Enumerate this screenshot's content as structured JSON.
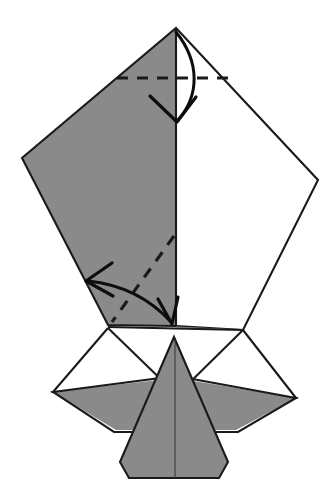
{
  "document": {
    "kind": "origami-folding-diagram",
    "title": "Origami fold step diagram",
    "canvas": {
      "width": 332,
      "height": 502
    },
    "background_color": "#ffffff"
  },
  "palette": {
    "paper_back_gray": "#8a8a8a",
    "paper_front_white": "#ffffff",
    "edge_black": "#1a1a1a",
    "crease_black": "#1a1a1a",
    "arrow_black": "#0d0d0d",
    "faint_edge": "#9a9a9a"
  },
  "geometry": {
    "apex": [
      176,
      28
    ],
    "left_vertex": [
      22,
      158
    ],
    "right_vertex": [
      318,
      180
    ],
    "center_line_x": 176,
    "mid_horizontal_y": 327,
    "body_apex": [
      174,
      337
    ],
    "body_bottom_left": [
      122,
      478
    ],
    "body_bottom_right": [
      228,
      478
    ],
    "left_wing_tip": [
      53,
      392
    ],
    "right_wing_tip": [
      296,
      398
    ],
    "left_flap_corner": [
      108,
      325
    ],
    "right_flap_corner": [
      240,
      330
    ]
  },
  "shapes": [
    {
      "name": "upper-left-back-panel",
      "fill": "paper_back_gray",
      "points": "176,28 176,325 108,325 22,158"
    },
    {
      "name": "upper-right-front-panel",
      "fill": "paper_front_white",
      "points": "176,28 318,180 243,330 176,325"
    },
    {
      "name": "lower-left-white-flap",
      "fill": "paper_front_white",
      "points": "108,328 176,328 176,394 53,392"
    },
    {
      "name": "lower-right-white-flap",
      "fill": "paper_front_white",
      "points": "176,328 243,330 296,398 176,396"
    },
    {
      "name": "left-gray-wing",
      "fill": "paper_back_gray",
      "points": "53,392 176,378 176,430 116,430"
    },
    {
      "name": "right-gray-wing",
      "fill": "paper_back_gray",
      "points": "296,398 176,378 176,430 236,430"
    },
    {
      "name": "center-body-gray",
      "fill": "paper_back_gray",
      "points": "174,337 228,462 218,478 130,478 120,462"
    }
  ],
  "creases": [
    {
      "name": "top-horizontal-valley-crease",
      "type": "dashed",
      "from": [
        117,
        78
      ],
      "to": [
        233,
        78
      ]
    },
    {
      "name": "diagonal-valley-crease",
      "type": "dashed",
      "from": [
        174,
        236
      ],
      "to": [
        112,
        322
      ]
    }
  ],
  "arrows": [
    {
      "name": "top-fold-down-arrow",
      "type": "curved-fold-arrow",
      "direction": "down",
      "curve": "M 176,32 C 198,62 198,96 176,122",
      "head_left": [
        151,
        98
      ],
      "head_right": [
        197,
        100
      ],
      "head_tip": [
        176,
        122
      ]
    },
    {
      "name": "lower-fold-left-arrow",
      "type": "curved-fold-arrow",
      "direction": "left-down",
      "curve": "M 86,280 C 128,284 152,300 170,322",
      "head_a": [
        110,
        264
      ],
      "head_b": [
        112,
        296
      ],
      "head_tip": [
        86,
        280
      ],
      "second_head_a": [
        160,
        300
      ],
      "second_head_b": [
        178,
        300
      ],
      "second_head_tip": [
        171,
        324
      ]
    }
  ],
  "labels": {
    "caption": "",
    "step_number": ""
  }
}
